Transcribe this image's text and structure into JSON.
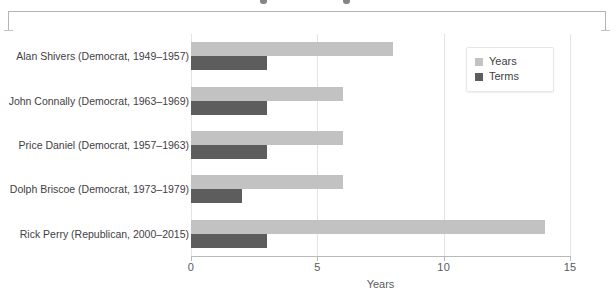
{
  "chart_data": {
    "type": "bar",
    "orientation": "horizontal",
    "title": "",
    "xlabel": "Years",
    "ylabel": "",
    "xlim": [
      0,
      15
    ],
    "xticks": [
      0,
      5,
      10,
      15
    ],
    "xticklabels": [
      "0",
      "5",
      "10",
      "15"
    ],
    "grid": true,
    "grid_axis": "x",
    "legend_position": "upper right",
    "categories": [
      "Alan Shivers (Democrat, 1949–1957)",
      "John Connally (Democrat, 1963–1969)",
      "Price Daniel (Democrat, 1957–1963)",
      "Dolph Briscoe (Democrat, 1973–1979)",
      "Rick Perry (Republican, 2000–2015)"
    ],
    "series": [
      {
        "name": "Years",
        "color": "#c2c2c2",
        "values": [
          8,
          6,
          6,
          6,
          14
        ]
      },
      {
        "name": "Terms",
        "color": "#5d5d5d",
        "values": [
          3,
          3,
          3,
          2,
          3
        ]
      }
    ]
  },
  "legend": {
    "items": [
      {
        "label": "Years",
        "color": "#c2c2c2"
      },
      {
        "label": "Terms",
        "color": "#5d5d5d"
      }
    ]
  },
  "axis": {
    "x_label": "Years",
    "tick_labels": [
      "0",
      "5",
      "10",
      "15"
    ]
  },
  "colors": {
    "years": "#c2c2c2",
    "terms": "#5d5d5d",
    "grid": "#e3e3e5",
    "axis": "#b9b9bb",
    "text": "#3f4044",
    "bracket": "#b4b4b6"
  }
}
